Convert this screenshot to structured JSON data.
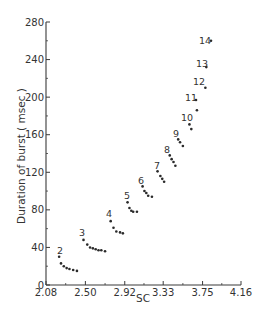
{
  "chart_data": {
    "type": "scatter",
    "title": "",
    "xlabel": "SC",
    "ylabel": "Duration of burst ( msec )",
    "xlim": [
      2.08,
      4.16
    ],
    "ylim": [
      0,
      280
    ],
    "x_ticks": [
      "2.08",
      "2.50",
      "2.92",
      "3.33",
      "3.75",
      "4.16"
    ],
    "y_ticks": [
      "0",
      "40",
      "80",
      "120",
      "160",
      "200",
      "240",
      "280"
    ],
    "grid": false,
    "legend": null,
    "series": [
      {
        "name": "2",
        "x": [
          2.22,
          2.24,
          2.27,
          2.3,
          2.33,
          2.37,
          2.41
        ],
        "y": [
          30,
          23,
          20,
          18,
          17,
          16,
          15
        ]
      },
      {
        "name": "3",
        "x": [
          2.48,
          2.52,
          2.55,
          2.58,
          2.61,
          2.64,
          2.67,
          2.71
        ],
        "y": [
          48,
          43,
          40,
          39,
          38,
          37,
          37,
          36
        ]
      },
      {
        "name": "4",
        "x": [
          2.77,
          2.8,
          2.83,
          2.87,
          2.9
        ],
        "y": [
          68,
          61,
          57,
          56,
          55
        ]
      },
      {
        "name": "5",
        "x": [
          2.95,
          2.97,
          2.99,
          3.01,
          3.05
        ],
        "y": [
          88,
          82,
          79,
          78,
          78
        ]
      },
      {
        "name": "6",
        "x": [
          3.11,
          3.13,
          3.15,
          3.17,
          3.21
        ],
        "y": [
          105,
          100,
          98,
          95,
          94
        ]
      },
      {
        "name": "7",
        "x": [
          3.27,
          3.3,
          3.32,
          3.34
        ],
        "y": [
          121,
          116,
          113,
          110
        ]
      },
      {
        "name": "8",
        "x": [
          3.4,
          3.42,
          3.44,
          3.46
        ],
        "y": [
          138,
          134,
          131,
          127
        ]
      },
      {
        "name": "9",
        "x": [
          3.49,
          3.51,
          3.54
        ],
        "y": [
          155,
          152,
          148
        ]
      },
      {
        "name": "10",
        "x": [
          3.61,
          3.63
        ],
        "y": [
          171,
          166
        ]
      },
      {
        "name": "11",
        "x": [
          3.68,
          3.69
        ],
        "y": [
          197,
          186
        ]
      },
      {
        "name": "12",
        "x": [
          3.78
        ],
        "y": [
          210
        ]
      },
      {
        "name": "13",
        "x": [
          3.79
        ],
        "y": [
          232
        ]
      },
      {
        "name": "14",
        "x": [
          3.84
        ],
        "y": [
          260
        ]
      }
    ],
    "annotations": [
      {
        "text": "2",
        "px": 57,
        "py": 254
      },
      {
        "text": "3",
        "px": 79,
        "py": 236
      },
      {
        "text": "4",
        "px": 106,
        "py": 217
      },
      {
        "text": "5",
        "px": 124,
        "py": 199
      },
      {
        "text": "6",
        "px": 138,
        "py": 184
      },
      {
        "text": "7",
        "px": 154,
        "py": 169
      },
      {
        "text": "8",
        "px": 164,
        "py": 153
      },
      {
        "text": "9",
        "px": 173,
        "py": 137
      },
      {
        "text": "10",
        "px": 181,
        "py": 121
      },
      {
        "text": "11",
        "px": 185,
        "py": 101
      },
      {
        "text": "12",
        "px": 193,
        "py": 85
      },
      {
        "text": "13",
        "px": 196,
        "py": 67
      },
      {
        "text": "14",
        "px": 199,
        "py": 44
      }
    ]
  },
  "layout": {
    "plot_left": 46,
    "plot_right": 241,
    "plot_top": 22,
    "plot_bottom": 285,
    "ink_color": "#3a3a3a",
    "point_color": "#2a2a2a"
  }
}
